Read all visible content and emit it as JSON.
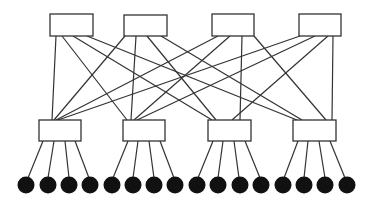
{
  "diagram": {
    "type": "fat-tree network topology",
    "colors": {
      "line": "#333333",
      "switch_fill": "#ffffff",
      "host_fill": "#111111",
      "background": "#ffffff"
    },
    "core_switches": [
      {
        "id": "core-1",
        "x": 50,
        "y": 14,
        "w": 43,
        "h": 22
      },
      {
        "id": "core-2",
        "x": 124,
        "y": 15,
        "w": 43,
        "h": 21
      },
      {
        "id": "core-3",
        "x": 212,
        "y": 14,
        "w": 42,
        "h": 22
      },
      {
        "id": "core-4",
        "x": 299,
        "y": 14,
        "w": 42,
        "h": 22
      }
    ],
    "edge_switches": [
      {
        "id": "edge-1",
        "x": 39,
        "y": 120,
        "w": 42,
        "h": 21
      },
      {
        "id": "edge-2",
        "x": 123,
        "y": 120,
        "w": 42,
        "h": 21
      },
      {
        "id": "edge-3",
        "x": 208,
        "y": 120,
        "w": 43,
        "h": 21
      },
      {
        "id": "edge-4",
        "x": 293,
        "y": 120,
        "w": 43,
        "h": 21
      }
    ],
    "core_edge_links": [
      {
        "x1": 56,
        "y1": 36,
        "x2": 52,
        "y2": 120
      },
      {
        "x1": 62,
        "y1": 36,
        "x2": 127,
        "y2": 120
      },
      {
        "x1": 73,
        "y1": 36,
        "x2": 212,
        "y2": 120
      },
      {
        "x1": 87,
        "y1": 36,
        "x2": 297,
        "y2": 120
      },
      {
        "x1": 125,
        "y1": 36,
        "x2": 54,
        "y2": 120
      },
      {
        "x1": 136,
        "y1": 36,
        "x2": 131,
        "y2": 120
      },
      {
        "x1": 147,
        "y1": 36,
        "x2": 216,
        "y2": 120
      },
      {
        "x1": 161,
        "y1": 36,
        "x2": 302,
        "y2": 120
      },
      {
        "x1": 218,
        "y1": 36,
        "x2": 56,
        "y2": 120
      },
      {
        "x1": 230,
        "y1": 36,
        "x2": 134,
        "y2": 120
      },
      {
        "x1": 242,
        "y1": 36,
        "x2": 240,
        "y2": 120
      },
      {
        "x1": 254,
        "y1": 36,
        "x2": 326,
        "y2": 120
      },
      {
        "x1": 300,
        "y1": 36,
        "x2": 58,
        "y2": 120
      },
      {
        "x1": 315,
        "y1": 36,
        "x2": 137,
        "y2": 120
      },
      {
        "x1": 328,
        "y1": 36,
        "x2": 232,
        "y2": 120
      },
      {
        "x1": 333,
        "y1": 36,
        "x2": 332,
        "y2": 120
      }
    ],
    "hosts": [
      {
        "cx": 26,
        "cy": 185,
        "r": 8.5
      },
      {
        "cx": 48,
        "cy": 185,
        "r": 8.5
      },
      {
        "cx": 69,
        "cy": 185,
        "r": 8.5
      },
      {
        "cx": 90,
        "cy": 185,
        "r": 8.5
      },
      {
        "cx": 112,
        "cy": 185,
        "r": 8.5
      },
      {
        "cx": 133,
        "cy": 185,
        "r": 8.5
      },
      {
        "cx": 154,
        "cy": 185,
        "r": 8.5
      },
      {
        "cx": 175,
        "cy": 185,
        "r": 8.5
      },
      {
        "cx": 197,
        "cy": 185,
        "r": 8.5
      },
      {
        "cx": 218,
        "cy": 185,
        "r": 8.5
      },
      {
        "cx": 240,
        "cy": 185,
        "r": 8.5
      },
      {
        "cx": 261,
        "cy": 185,
        "r": 8.5
      },
      {
        "cx": 283,
        "cy": 185,
        "r": 8.5
      },
      {
        "cx": 304,
        "cy": 185,
        "r": 8.5
      },
      {
        "cx": 325,
        "cy": 185,
        "r": 8.5
      },
      {
        "cx": 347,
        "cy": 185,
        "r": 8.5
      }
    ],
    "edge_host_links": [
      {
        "x1": 43,
        "y1": 141,
        "x2": 28,
        "y2": 178
      },
      {
        "x1": 54,
        "y1": 141,
        "x2": 48,
        "y2": 178
      },
      {
        "x1": 65,
        "y1": 141,
        "x2": 69,
        "y2": 178
      },
      {
        "x1": 75,
        "y1": 141,
        "x2": 89,
        "y2": 178
      },
      {
        "x1": 128,
        "y1": 141,
        "x2": 113,
        "y2": 178
      },
      {
        "x1": 138,
        "y1": 141,
        "x2": 133,
        "y2": 178
      },
      {
        "x1": 149,
        "y1": 141,
        "x2": 154,
        "y2": 178
      },
      {
        "x1": 160,
        "y1": 141,
        "x2": 174,
        "y2": 178
      },
      {
        "x1": 213,
        "y1": 141,
        "x2": 198,
        "y2": 178
      },
      {
        "x1": 223,
        "y1": 141,
        "x2": 218,
        "y2": 178
      },
      {
        "x1": 234,
        "y1": 141,
        "x2": 239,
        "y2": 178
      },
      {
        "x1": 245,
        "y1": 141,
        "x2": 260,
        "y2": 178
      },
      {
        "x1": 298,
        "y1": 141,
        "x2": 284,
        "y2": 178
      },
      {
        "x1": 308,
        "y1": 141,
        "x2": 304,
        "y2": 178
      },
      {
        "x1": 319,
        "y1": 141,
        "x2": 325,
        "y2": 178
      },
      {
        "x1": 330,
        "y1": 141,
        "x2": 345,
        "y2": 178
      }
    ]
  }
}
